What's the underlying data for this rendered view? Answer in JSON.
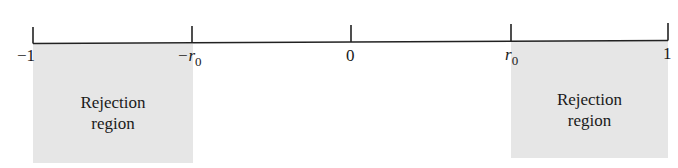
{
  "diagram": {
    "type": "number-line",
    "axis": {
      "min": -1,
      "max": 1,
      "ticks": [
        {
          "value": -1,
          "label_main": "−1",
          "label_sub": ""
        },
        {
          "value": "-r0",
          "label_main": "−r",
          "label_sub": "0"
        },
        {
          "value": 0,
          "label_main": "0",
          "label_sub": ""
        },
        {
          "value": "r0",
          "label_main": "r",
          "label_sub": "0"
        },
        {
          "value": 1,
          "label_main": "1",
          "label_sub": ""
        }
      ]
    },
    "regions": [
      {
        "from": -1,
        "to": "-r0",
        "line1": "Rejection",
        "line2": "region",
        "color": "#e6e6e6"
      },
      {
        "from": "r0",
        "to": 1,
        "line1": "Rejection",
        "line2": "region",
        "color": "#e6e6e6"
      }
    ]
  }
}
